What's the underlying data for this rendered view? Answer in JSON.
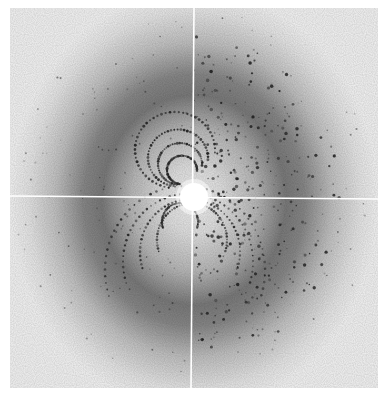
{
  "image": {
    "subject": "X-ray diffraction pattern",
    "width": 388,
    "height": 396,
    "detector": {
      "x": 10,
      "y": 8,
      "width": 368,
      "height": 380
    },
    "beam_center": {
      "x": 194,
      "y": 197,
      "radius": 14
    },
    "crosshair": {
      "vertical": {
        "x1": 194,
        "y1": 8,
        "x2": 191,
        "y2": 388
      },
      "horizontal": {
        "x1": 10,
        "y1": 196,
        "x2": 378,
        "y2": 199
      }
    },
    "colors": {
      "background": "#ffffff",
      "detector_edge": "#f2f2f2",
      "halo_dark": "#7a7a7a",
      "inner_light": "#e6e6e6",
      "spot": "#1e1e1e",
      "beam_stop": "#ffffff",
      "crosshair": "#ffffff"
    }
  }
}
